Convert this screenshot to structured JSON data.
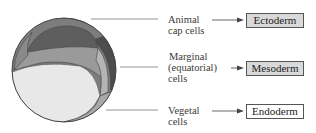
{
  "diagram": {
    "regions": [
      {
        "label_line1": "Animal",
        "label_line2": "cap cells",
        "label_line3": "",
        "fate": "Ectoderm",
        "box_fill": "#d9d9d9"
      },
      {
        "label_line1": "Marginal",
        "label_line2": "(equatorial)",
        "label_line3": "cells",
        "fate": "Mesoderm",
        "box_fill": "#d9d9d9"
      },
      {
        "label_line1": "Vegetal",
        "label_line2": "cells",
        "label_line3": "",
        "fate": "Endoderm",
        "box_fill": "#ffffff"
      }
    ],
    "colors": {
      "animal_dark": "#5a5a5a",
      "marginal_mid": "#8c8c8c",
      "vegetal_light": "#e6e6e6",
      "outline": "#444444",
      "leader_line": "#666666"
    }
  }
}
